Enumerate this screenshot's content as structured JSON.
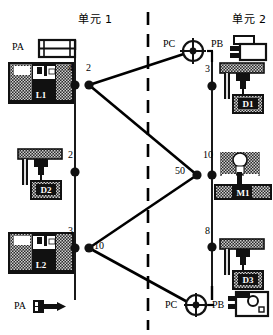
{
  "diagram": {
    "title_left": "单元 1",
    "title_right": "单元 2",
    "colors": {
      "line": "#000000",
      "fill_dark": "#1a1a1a",
      "fill_hatch": "#9a9a9a",
      "background": "#ffffff"
    }
  },
  "cells": [
    {
      "id": "cell-1",
      "label": "单元 1",
      "x": 78,
      "y": 16
    },
    {
      "id": "cell-2",
      "label": "单元 2",
      "x": 238,
      "y": 16
    }
  ],
  "ports": [
    {
      "id": "pa-top",
      "label": "PA",
      "x": 14,
      "y": 45,
      "icon": "pallet-icon"
    },
    {
      "id": "pa-bottom",
      "label": "PA",
      "x": 16,
      "y": 307,
      "icon": "tool-arrow-icon"
    },
    {
      "id": "pc-top",
      "label": "PC",
      "x": 166,
      "y": 44,
      "icon": "target-icon"
    },
    {
      "id": "pb-top",
      "label": "PB",
      "x": 212,
      "y": 44,
      "icon": "bracket-icon"
    },
    {
      "id": "pc-bottom",
      "label": "PC",
      "x": 168,
      "y": 308,
      "icon": "target-icon"
    },
    {
      "id": "pb-bottom",
      "label": "PB",
      "x": 215,
      "y": 308,
      "icon": "bracket-icon"
    }
  ],
  "machines": [
    {
      "id": "L1",
      "label": "L1",
      "type": "lathe",
      "x": 8,
      "y": 62,
      "w": 66,
      "h": 42
    },
    {
      "id": "D1",
      "label": "D1",
      "type": "drill",
      "x": 218,
      "y": 62,
      "w": 48,
      "h": 52
    },
    {
      "id": "D2",
      "label": "D2",
      "type": "drill",
      "x": 16,
      "y": 148,
      "w": 48,
      "h": 52
    },
    {
      "id": "M1",
      "label": "M1",
      "type": "mill",
      "x": 214,
      "y": 152,
      "w": 58,
      "h": 48
    },
    {
      "id": "L2",
      "label": "L2",
      "type": "lathe",
      "x": 8,
      "y": 232,
      "w": 66,
      "h": 42
    },
    {
      "id": "D3",
      "label": "D3",
      "type": "drill",
      "x": 218,
      "y": 238,
      "w": 48,
      "h": 52
    }
  ],
  "nodes": [
    {
      "id": "n-4",
      "label": "4",
      "x": 75,
      "y": 85,
      "label_x": 68,
      "label_y": 66
    },
    {
      "id": "n-2a",
      "label": "2",
      "x": 89,
      "y": 85,
      "label_x": 86,
      "label_y": 66
    },
    {
      "id": "n-2b",
      "label": "2",
      "x": 75,
      "y": 172,
      "label_x": 68,
      "label_y": 152
    },
    {
      "id": "n-3a",
      "label": "3",
      "x": 75,
      "y": 248,
      "label_x": 68,
      "label_y": 228
    },
    {
      "id": "n-10a",
      "label": "10",
      "x": 89,
      "y": 248,
      "label_x": 94,
      "label_y": 242
    },
    {
      "id": "n-50",
      "label": "50",
      "x": 197,
      "y": 175,
      "label_x": 177,
      "label_y": 168
    },
    {
      "id": "n-10b",
      "label": "10",
      "x": 212,
      "y": 175,
      "label_x": 203,
      "label_y": 152
    },
    {
      "id": "n-3b",
      "label": "3",
      "x": 212,
      "y": 86,
      "label_x": 206,
      "label_y": 66
    },
    {
      "id": "n-8",
      "label": "8",
      "x": 212,
      "y": 247,
      "label_x": 206,
      "label_y": 228
    }
  ],
  "rails": [
    {
      "id": "rail-left",
      "x": 75,
      "y1": 54,
      "y2": 300
    },
    {
      "id": "rail-right",
      "x": 212,
      "y1": 56,
      "y2": 300
    }
  ],
  "rail_stubs": [
    {
      "id": "stub-left-top",
      "x": 75,
      "y1": 40,
      "y2": 50
    },
    {
      "id": "stub-right-bottom",
      "x": 212,
      "y1": 286,
      "y2": 300
    }
  ],
  "divider": {
    "id": "cell-divider",
    "x": 148,
    "y1": 12,
    "y2": 330,
    "style": "dashed"
  },
  "transport_links": [
    {
      "id": "link-2a-pc-top",
      "from": "n-2a",
      "to": "pc-top",
      "x1": 89,
      "y1": 85,
      "x2": 193,
      "y2": 51
    },
    {
      "id": "link-2a-50",
      "from": "n-2a",
      "to": "n-50",
      "x1": 89,
      "y1": 85,
      "x2": 197,
      "y2": 175
    },
    {
      "id": "link-50-10a",
      "from": "n-50",
      "to": "n-10a",
      "x1": 197,
      "y1": 175,
      "x2": 89,
      "y2": 248
    },
    {
      "id": "link-10a-pc-bot",
      "from": "n-10a",
      "to": "pc-bottom",
      "x1": 89,
      "y1": 248,
      "x2": 193,
      "y2": 305
    }
  ],
  "port_connectors": [
    {
      "id": "conn-pb-top",
      "x1": 207,
      "y1": 51,
      "x2": 212,
      "y2": 51
    },
    {
      "id": "conn-pc-bottom",
      "x1": 186,
      "y1": 305,
      "x2": 196,
      "y2": 305
    },
    {
      "id": "conn-pb-bottom",
      "x1": 205,
      "y1": 305,
      "x2": 214,
      "y2": 305
    }
  ]
}
